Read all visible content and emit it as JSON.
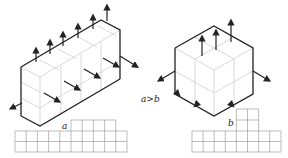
{
  "diagram": {
    "left_block": {
      "label": "a",
      "cells_long": 5,
      "top_arrow_count": 6,
      "bottom_arrow_count": 4
    },
    "right_block": {
      "label": "b",
      "cells_per_side": 2,
      "top_arrow_count": 3,
      "bottom_arrow_count": 2
    },
    "comparison": "a>b",
    "left_grid": {
      "label": "a",
      "bottom_rows": 2,
      "bottom_cols": 10,
      "upper_cols": 4
    },
    "right_grid": {
      "label": "b",
      "bottom_rows": 2,
      "bottom_cols": 8,
      "tower_cols": 2,
      "tower_rows": 2
    },
    "colors": {
      "edge": "#222222",
      "hidden_edge": "#bbbbbb",
      "grid": "#999999"
    }
  }
}
